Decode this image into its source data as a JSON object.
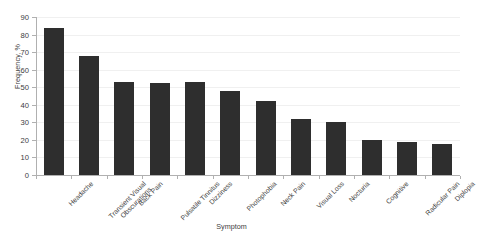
{
  "chart_data": {
    "type": "bar",
    "title": "",
    "xlabel": "Symptom",
    "ylabel": "Frequency, %",
    "categories": [
      "Headache",
      "Transient Visual Obscurations",
      "Back Pain",
      "Pulsatile Tinnitus",
      "Dizziness",
      "Photophobia",
      "Neck Pain",
      "Visual Loss",
      "Nocturia",
      "Cognitive",
      "Radicular Pain",
      "Diplopia"
    ],
    "values": [
      84,
      68,
      53,
      52.5,
      53,
      48,
      42,
      32,
      30,
      20,
      19,
      17.5
    ],
    "ylim": [
      0,
      90
    ],
    "ytick_labels": [
      "0",
      "10",
      "20",
      "30",
      "40",
      "50",
      "60",
      "70",
      "80",
      "90"
    ],
    "ytick_values": [
      0,
      10,
      20,
      30,
      40,
      50,
      60,
      70,
      80,
      90
    ],
    "grid": true,
    "legend": "none",
    "bar_color": "#2e2e2e",
    "background_color": "#ffffff",
    "gridline_color": "#f0f0f0",
    "axis_color": "#b0b0b0"
  }
}
